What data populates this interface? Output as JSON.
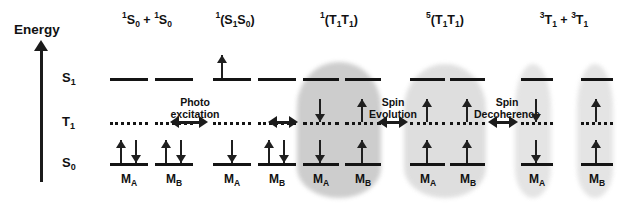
{
  "figure": {
    "type": "energy-level-diagram",
    "axis": {
      "label": "Energy",
      "direction": "up",
      "states": [
        {
          "id": "S1",
          "text": "S₁",
          "html": "S<sub>1</sub>",
          "y": 78,
          "style": "solid"
        },
        {
          "id": "T1",
          "text": "T₁",
          "html": "T<sub>1</sub>",
          "y": 122,
          "style": "dotted"
        },
        {
          "id": "S0",
          "text": "S₀",
          "html": "S<sub>0</sub>",
          "y": 163,
          "style": "solid"
        }
      ]
    },
    "molecule_labels": {
      "a": "Mₐ",
      "b": "M_B",
      "a_html": "M<sub>A</sub>",
      "b_html": "M<sub>B</sub>"
    },
    "columns": [
      {
        "id": "col-1",
        "header": "¹S₀ + ¹S₀",
        "header_html": "<sup>1</sup>S<sub>0</sub> + <sup>1</sup>S<sub>0</sub>",
        "shaded": false,
        "shading": "none",
        "molecules": [
          {
            "name": "M_A",
            "s1": [],
            "t1": [],
            "s0": [
              "up",
              "down"
            ]
          },
          {
            "name": "M_B",
            "s1": [],
            "t1": [],
            "s0": [
              "up",
              "down"
            ]
          }
        ]
      },
      {
        "id": "col-2",
        "header": "¹(S₁S₀)",
        "header_html": "<sup>1</sup>(S<sub>1</sub>S<sub>0</sub>)",
        "shaded": false,
        "shading": "none",
        "molecules": [
          {
            "name": "M_A",
            "s1": [
              "up"
            ],
            "t1": [],
            "s0": [
              "down"
            ]
          },
          {
            "name": "M_B",
            "s1": [],
            "t1": [],
            "s0": [
              "up",
              "down"
            ]
          }
        ]
      },
      {
        "id": "col-3",
        "header": "¹(T₁T₁)",
        "header_html": "<sup>1</sup>(T<sub>1</sub>T<sub>1</sub>)",
        "shaded": true,
        "shading": "single-dark-cloud",
        "molecules": [
          {
            "name": "M_A",
            "s1": [],
            "t1": [
              "down"
            ],
            "s0": [
              "down"
            ]
          },
          {
            "name": "M_B",
            "s1": [],
            "t1": [
              "up"
            ],
            "s0": [
              "up"
            ]
          }
        ]
      },
      {
        "id": "col-4",
        "header": "⁵(T₁T₁)",
        "header_html": "<sup>5</sup>(T<sub>1</sub>T<sub>1</sub>)",
        "shaded": true,
        "shading": "single-light-cloud",
        "molecules": [
          {
            "name": "M_A",
            "s1": [],
            "t1": [
              "up"
            ],
            "s0": [
              "up"
            ]
          },
          {
            "name": "M_B",
            "s1": [],
            "t1": [
              "up"
            ],
            "s0": [
              "up"
            ]
          }
        ]
      },
      {
        "id": "col-5",
        "header": "³T₁ + ³T₁",
        "header_html": "<sup>3</sup>T<sub>1</sub> + <sup>3</sup>T<sub>1</sub>",
        "shaded": true,
        "shading": "two-separate-clouds",
        "molecules": [
          {
            "name": "M_A",
            "s1": [],
            "t1": [
              "down"
            ],
            "s0": [
              "down"
            ]
          },
          {
            "name": "M_B",
            "s1": [],
            "t1": [
              "up"
            ],
            "s0": [
              "up"
            ]
          }
        ]
      }
    ],
    "processes": [
      {
        "id": "proc-1",
        "line1": "Photo",
        "line2": "excitation",
        "between": [
          "col-1",
          "col-2"
        ]
      },
      {
        "id": "proc-2",
        "line1": "",
        "line2": "",
        "between": [
          "col-2",
          "col-3"
        ]
      },
      {
        "id": "proc-3",
        "line1": "Spin",
        "line2": "Evolution",
        "between": [
          "col-3",
          "col-4"
        ]
      },
      {
        "id": "proc-4",
        "line1": "Spin",
        "line2": "Decoherence",
        "between": [
          "col-4",
          "col-5"
        ]
      }
    ],
    "colors": {
      "ink": "#141414",
      "cloud_dark": "#c9c9c9",
      "cloud_light": "#dcdcdc",
      "cloud_lighter": "#e2e2e2",
      "background": "#ffffff"
    }
  }
}
